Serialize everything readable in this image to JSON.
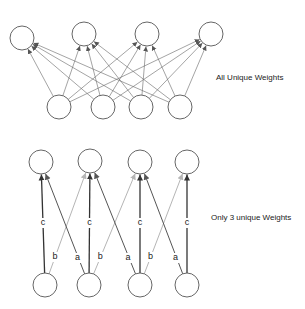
{
  "diagram": {
    "top_section": {
      "caption": "All Unique Weights",
      "output_nodes": 4,
      "input_nodes": 4,
      "connectivity": "fully-connected"
    },
    "bottom_section": {
      "caption": "Only 3 unique Weights",
      "output_nodes": 4,
      "input_nodes": 4,
      "connectivity": "shared-weights",
      "weights": [
        {
          "label": "c",
          "meaning": "input i to output i"
        },
        {
          "label": "a",
          "meaning": "input i+1 to output i"
        },
        {
          "label": "b",
          "meaning": "input i to output i+1"
        }
      ]
    },
    "colors": {
      "node_stroke": "#555555",
      "weight_c": "#333333",
      "weight_a": "#555555",
      "weight_b": "#b5b5b5"
    }
  }
}
